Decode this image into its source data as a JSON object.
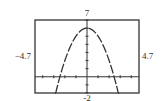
{
  "chart_data": {
    "type": "line",
    "title": "",
    "function": "y = 6 - x^2",
    "window": {
      "xmin": -4.7,
      "xmax": 4.7,
      "ymin": -2,
      "ymax": 7,
      "xscl": 1,
      "yscl": 1
    },
    "labels": {
      "top": "7",
      "bottom": "-2",
      "left": "−4.7",
      "right": "4.7"
    },
    "series": [
      {
        "name": "parabola",
        "x": [
          -2.9,
          -2.5,
          -2,
          -1.5,
          -1,
          -0.5,
          0,
          0.5,
          1,
          1.5,
          2,
          2.5,
          2.9
        ],
        "y": [
          -2.41,
          -0.25,
          2,
          3.75,
          5,
          5.75,
          6,
          5.75,
          5,
          3.75,
          2,
          -0.25,
          -2.41
        ]
      }
    ],
    "grid": false,
    "legend": "none"
  }
}
